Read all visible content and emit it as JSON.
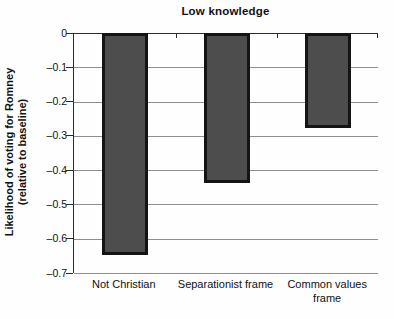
{
  "chart_data": {
    "type": "bar",
    "title": "Low knowledge",
    "categories": [
      "Not Christian",
      "Separationist frame",
      "Common values frame"
    ],
    "category_label_lines": [
      [
        "Not Christian"
      ],
      [
        "Separationist frame"
      ],
      [
        "Common values",
        "frame"
      ]
    ],
    "values": [
      -0.645,
      -0.435,
      -0.275
    ],
    "xlabel": "",
    "ylabel": "Likelihood of voting for Romney (relative to baseline)",
    "ylabel_lines": [
      "Likelihood of voting for Romney",
      "(relative to baseline)"
    ],
    "ylim": [
      -0.7,
      0
    ],
    "ytick_step": 0.1,
    "yticks": [
      0,
      -0.1,
      -0.2,
      -0.3,
      -0.4,
      -0.5,
      -0.6,
      -0.7
    ],
    "ytick_labels": [
      "0",
      "–0.1",
      "–0.2",
      "–0.3",
      "–0.4",
      "–0.5",
      "–0.6",
      "–0.7"
    ],
    "grid": true,
    "legend": false,
    "colors": {
      "bar_fill": "#4d4d4d",
      "bar_border": "#141414",
      "gridline": "#8f8f8f",
      "axis": "#2b2b2b",
      "text": "#111111",
      "background": "#ffffff"
    }
  }
}
